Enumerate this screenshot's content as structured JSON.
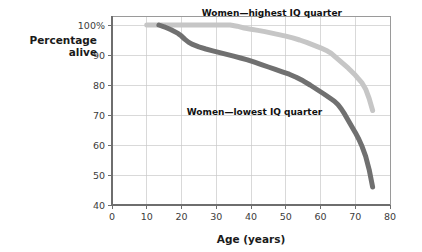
{
  "chart_data": {
    "type": "line",
    "title": "",
    "xlabel": "Age (years)",
    "ylabel_line1": "Percentage",
    "ylabel_line2": "alive",
    "xlim": [
      0,
      80
    ],
    "ylim": [
      40,
      103
    ],
    "grid": true,
    "legend_position": "inline-annotation",
    "xticks": [
      0,
      10,
      20,
      30,
      40,
      50,
      60,
      70,
      80
    ],
    "xticklabels": [
      "0",
      "10",
      "20",
      "30",
      "40",
      "50",
      "60",
      "70",
      "80"
    ],
    "yticks": [
      40,
      50,
      60,
      70,
      80,
      90,
      100
    ],
    "yticklabels": [
      "40",
      "50",
      "60",
      "70",
      "80",
      "90",
      "100%"
    ],
    "series": [
      {
        "name": "Women—highest IQ quarter",
        "color": "#c6c6c6",
        "linewidth": 5.0,
        "label_x": 46,
        "label_y": 103,
        "x": [
          10,
          14,
          18,
          22,
          26,
          30,
          34,
          36,
          38,
          40,
          42,
          44,
          46,
          48,
          50,
          52,
          54,
          56,
          58,
          60,
          62,
          63,
          64,
          65,
          66,
          68,
          70,
          72,
          73,
          74,
          75
        ],
        "y": [
          100,
          100,
          100,
          100,
          100,
          100,
          100,
          99.6,
          99.0,
          98.6,
          98.2,
          97.8,
          97.3,
          96.8,
          96.3,
          95.7,
          95.0,
          94.2,
          93.3,
          92.4,
          91.3,
          90.6,
          89.6,
          88.6,
          87.6,
          85.6,
          83.3,
          80.6,
          78.6,
          75.5,
          71.5
        ]
      },
      {
        "name": "Women—lowest IQ quarter",
        "color": "#707070",
        "linewidth": 5.0,
        "label_x": 41,
        "label_y": 70,
        "x": [
          13.5,
          15,
          17,
          19,
          20,
          21,
          22,
          23,
          25,
          27,
          29,
          31,
          33,
          35,
          37,
          39,
          41,
          43,
          45,
          47,
          49,
          51,
          53,
          55,
          57,
          59,
          61,
          63,
          64,
          65,
          66,
          67,
          68,
          69,
          70,
          71,
          72,
          73,
          74,
          75
        ],
        "y": [
          100,
          99.4,
          98.4,
          97.2,
          96.3,
          95.2,
          94.3,
          93.6,
          92.7,
          92.0,
          91.4,
          90.8,
          90.2,
          89.6,
          89.0,
          88.4,
          87.6,
          86.8,
          86.0,
          85.2,
          84.4,
          83.6,
          82.6,
          81.4,
          80.0,
          78.5,
          77.0,
          75.4,
          74.6,
          73.5,
          72.0,
          70.2,
          68.2,
          66.2,
          64.2,
          62.0,
          59.4,
          56.2,
          51.8,
          46.0
        ]
      }
    ]
  },
  "plot": {
    "left_px": 112,
    "right_px": 390,
    "top_px": 16,
    "bottom_px": 205
  }
}
